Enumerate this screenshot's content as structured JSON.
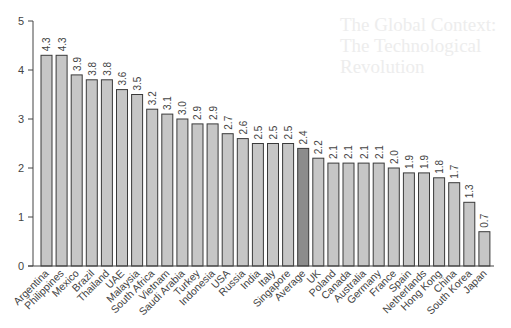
{
  "chart_data": {
    "type": "bar",
    "title": "",
    "xlabel": "",
    "ylabel": "",
    "ylim": [
      0,
      5
    ],
    "yticks": [
      0,
      1,
      2,
      3,
      4,
      5
    ],
    "grid": false,
    "legend": null,
    "categories": [
      "Argentina",
      "Philippines",
      "Mexico",
      "Brazil",
      "Thailand",
      "UAE",
      "Malaysia",
      "South Africa",
      "Vietnam",
      "Saudi Arabia",
      "Turkey",
      "Indonesia",
      "USA",
      "Russia",
      "India",
      "Italy",
      "Singapore",
      "Average",
      "UK",
      "Poland",
      "Canada",
      "Australia",
      "Germany",
      "France",
      "Spain",
      "Netherlands",
      "Hong Kong",
      "China",
      "South Korea",
      "Japan"
    ],
    "values": [
      4.3,
      4.3,
      3.9,
      3.8,
      3.8,
      3.6,
      3.5,
      3.2,
      3.1,
      3.0,
      2.9,
      2.9,
      2.7,
      2.6,
      2.5,
      2.5,
      2.5,
      2.4,
      2.2,
      2.1,
      2.1,
      2.1,
      2.1,
      2.0,
      1.9,
      1.9,
      1.8,
      1.7,
      1.3,
      0.7
    ],
    "value_labels": [
      "4.3",
      "4.3",
      "3.9",
      "3.8",
      "3.8",
      "3.6",
      "3.5",
      "3.2",
      "3.1",
      "3.0",
      "2.9",
      "2.9",
      "2.7",
      "2.6",
      "2.5",
      "2.5",
      "2.5",
      "2.4",
      "2.2",
      "2.1",
      "2.1",
      "2.1",
      "2.1",
      "2.0",
      "1.9",
      "1.9",
      "1.8",
      "1.7",
      "1.3",
      "0.7"
    ],
    "highlight_category": "Average",
    "colors": {
      "bar": "#c6c6c6",
      "highlight": "#8c8c8c",
      "outline": "#3a3a3a",
      "axis": "#444444",
      "text": "#444444"
    }
  },
  "background_bleed_text": "The Global Context:\nThe Technological\nRevolution"
}
